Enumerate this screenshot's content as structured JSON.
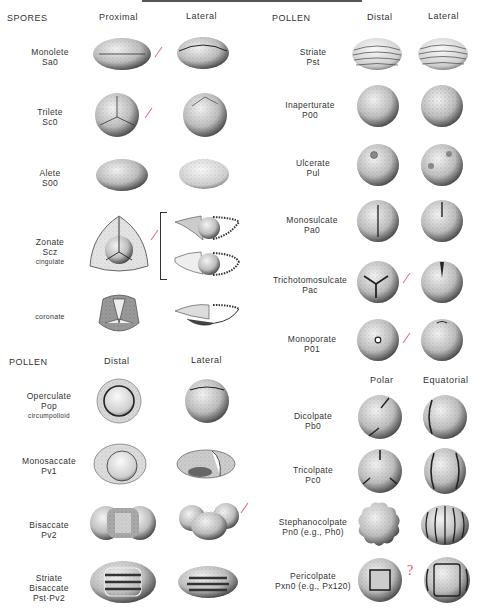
{
  "spores": {
    "title": "SPORES",
    "col_headers": [
      "Proximal",
      "Lateral"
    ],
    "rows": [
      {
        "name": "Monolete",
        "code": "Sa0",
        "sub": ""
      },
      {
        "name": "Trilete",
        "code": "Sc0",
        "sub": ""
      },
      {
        "name": "Alete",
        "code": "S00",
        "sub": ""
      },
      {
        "name": "Zonate",
        "code": "Scz",
        "sub": "cingulate"
      },
      {
        "name": "",
        "code": "",
        "sub": "coronate"
      }
    ]
  },
  "pollen_left": {
    "title": "POLLEN",
    "col_headers": [
      "Distal",
      "Lateral"
    ],
    "rows": [
      {
        "name": "Operculate",
        "code": "Pop",
        "sub": "circumpolloid"
      },
      {
        "name": "Monosaccate",
        "code": "Pv1",
        "sub": ""
      },
      {
        "name": "Bisaccate",
        "code": "Pv2",
        "sub": ""
      },
      {
        "name": "Striate",
        "code": "Bisaccate",
        "sub": "Pst·Pv2"
      }
    ]
  },
  "pollen_right": {
    "title": "POLLEN",
    "col_headers": [
      "Distal",
      "Lateral"
    ],
    "rows": [
      {
        "name": "Striate",
        "code": "Pst"
      },
      {
        "name": "Inaperturate",
        "code": "P00"
      },
      {
        "name": "Ulcerate",
        "code": "Pul"
      },
      {
        "name": "Monosulcate",
        "code": "Pa0"
      },
      {
        "name": "Trichotomosulcate",
        "code": "Pac"
      },
      {
        "name": "Monoporate",
        "code": "P01"
      }
    ],
    "col_headers_2": [
      "Polar",
      "Equatorial"
    ],
    "rows_2": [
      {
        "name": "Dicolpate",
        "code": "Pb0"
      },
      {
        "name": "Tricolpate",
        "code": "Pc0"
      },
      {
        "name": "Stephanocolpate",
        "code": "Pn0 (e.g., Ph0)"
      },
      {
        "name": "Pericolpate",
        "code": "Pxn0 (e.g., Px120)"
      }
    ]
  },
  "annotations": {
    "question_mark": "?"
  }
}
